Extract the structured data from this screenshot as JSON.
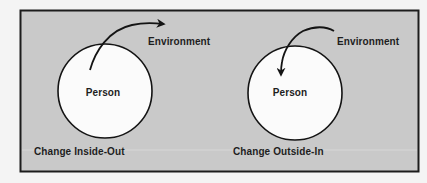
{
  "colors": {
    "page_background": "#f4f4f4",
    "panel_fill": "#c9c9c9",
    "panel_border": "#1c1c1c",
    "circle_fill": "#fbfbfb",
    "stroke": "#141414",
    "text": "#1e1e1e"
  },
  "panels": [
    {
      "id": "inside-out",
      "caption": "Change Inside-Out",
      "circle_label": "Person",
      "outer_label": "Environment",
      "arrow_direction": "from person out to environment"
    },
    {
      "id": "outside-in",
      "caption": "Change Outside-In",
      "circle_label": "Person",
      "outer_label": "Environment",
      "arrow_direction": "from environment in to person"
    }
  ]
}
